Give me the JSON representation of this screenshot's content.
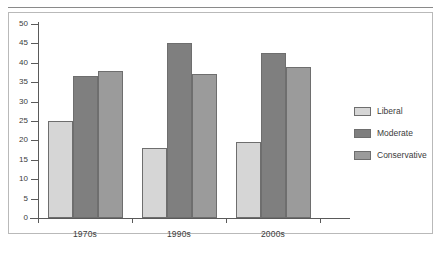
{
  "chart_data": {
    "type": "bar",
    "title": "",
    "subtitle": "",
    "xlabel": "",
    "ylabel": "",
    "categories": [
      "1970s",
      "1990s",
      "2000s"
    ],
    "series": [
      {
        "name": "Liberal",
        "color": "#d6d6d6",
        "values": [
          25,
          18,
          19.5
        ]
      },
      {
        "name": "Moderate",
        "color": "#7f7f7f",
        "values": [
          36.5,
          45,
          42.5
        ]
      },
      {
        "name": "Conservative",
        "color": "#9b9b9b",
        "values": [
          38,
          37,
          39
        ]
      }
    ],
    "ylim": [
      0,
      50
    ],
    "ytick_step": 5,
    "yticks": [
      0,
      5,
      10,
      15,
      20,
      25,
      30,
      35,
      40,
      45,
      50
    ],
    "ytick_labels": [
      "0",
      "5",
      "10",
      "15",
      "20",
      "25",
      "30",
      "35",
      "40",
      "45",
      "50"
    ],
    "grid": false,
    "legend_position": "right",
    "annotations": []
  },
  "legend": {
    "items": [
      {
        "label": "Liberal"
      },
      {
        "label": "Moderate"
      },
      {
        "label": "Conservative"
      }
    ]
  }
}
